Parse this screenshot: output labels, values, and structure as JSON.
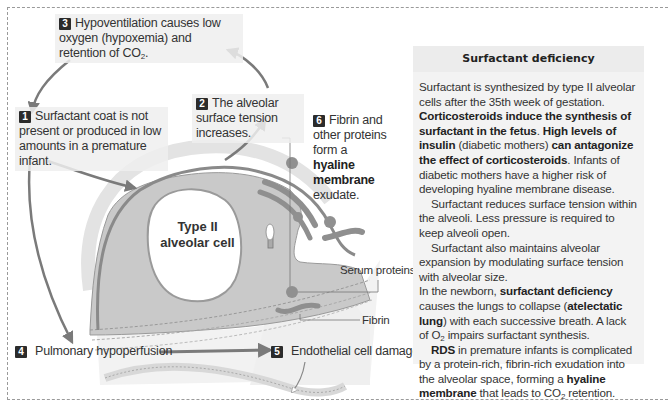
{
  "colors": {
    "cell_fill": "#c9c9c9",
    "arrow": "#7a7a7a",
    "membrane": "#8a8a8a",
    "hyaline_blob": "#8f8f8f",
    "panel_bg": "#f3f3f3",
    "badge_bg": "#2b2b2b",
    "frame_dash": "#9a9a9a"
  },
  "diagram": {
    "steps": [
      {
        "num": "1",
        "text": "Surfactant coat is not present or produced in low amounts in a premature infant."
      },
      {
        "num": "2",
        "text": "The alveolar surface tension increases."
      },
      {
        "num": "3",
        "text_pre": "Hypoventilation causes low oxygen (hypoxemia) and retention of CO",
        "sub": "2",
        "text_post": "."
      },
      {
        "num": "4",
        "text": "Pulmonary hypoperfusion"
      },
      {
        "num": "5",
        "text": "Endothelial cell damage"
      },
      {
        "num": "6",
        "text_pre": "Fibrin and other proteins form a",
        "bold": "hyaline membrane",
        "text_post": "exudate."
      }
    ],
    "cell_label_line1": "Type II",
    "cell_label_line2": "alveolar cell",
    "serum_proteins_label": "Serum proteins",
    "fibrin_label": "Fibrin"
  },
  "panel": {
    "title": "Surfactant deficiency",
    "p1": {
      "t1": "Surfactant is synthesized by type II alveolar cells after the 35th week of gestation. ",
      "b1": "Corticosteroids induce the synthesis of surfactant in the fetus",
      "t2": ". ",
      "b2": "High levels of insulin",
      "t3": " (diabetic mothers) ",
      "b3": "can antagonize the effect of corticosteroids",
      "t4": ". Infants of diabetic mothers have a higher risk of developing hyaline membrane disease."
    },
    "p2": "Surfactant reduces surface tension within the alveoli. Less pressure is required to keep alveoli open.",
    "p3": {
      "t1": "Surfactant also maintains alveolar expansion by modulating surface tension with alveolar size.",
      "t2": "In the newborn, ",
      "b1": "surfactant deficiency",
      "t3": " causes the lungs to collapse (",
      "b2": "atelectatic lung",
      "t4": ") with each successive breath.  A lack of O",
      "sub": "2",
      "t5": " impairs surfactant synthesis."
    },
    "p4": {
      "b1": "RDS",
      "t1": " in premature infants is complicated by a protein-rich, fibrin-rich exudation into the alveolar space, forming a ",
      "b2": "hyaline membrane",
      "t2": " that leads to CO",
      "sub": "2",
      "t3": " retention."
    }
  }
}
